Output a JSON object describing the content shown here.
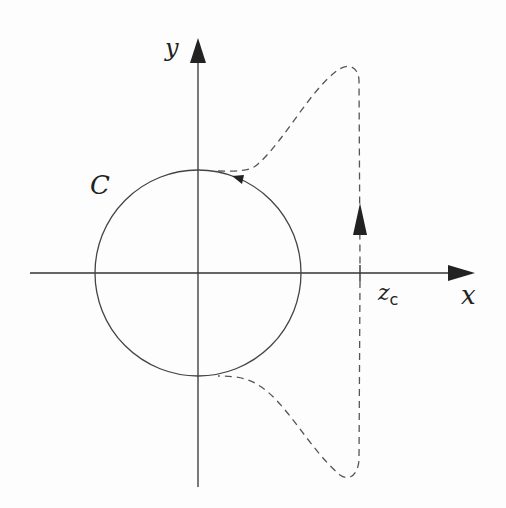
{
  "figure": {
    "type": "contour diagram in complex plane",
    "axes": {
      "x_label": "x",
      "y_label": "y"
    },
    "circle": {
      "label": "C",
      "orientation": "counterclockwise"
    },
    "point": {
      "label_main": "z",
      "label_sub": "c"
    },
    "contour": {
      "style": "dashed",
      "direction_arrow": "up along vertical line x = z_c"
    },
    "colors": {
      "stroke": "#333333",
      "background": "#fdfdfd"
    }
  }
}
